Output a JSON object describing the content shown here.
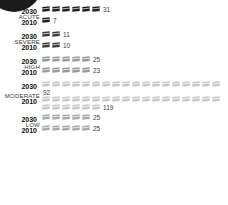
{
  "logo": {
    "name": "dark-rounded-mark"
  },
  "chart_data": {
    "type": "bar",
    "subtype": "pictogram-isotype",
    "title": "",
    "subtitle": "",
    "xlabel": "",
    "ylabel": "",
    "icon_unit": 5,
    "icon_glyph": "flag-icon",
    "categories": [
      "ACUTE",
      "SEVERE",
      "HIGH",
      "MODERATE",
      "LOW"
    ],
    "series": [
      {
        "name": "2030",
        "values": [
          31,
          11,
          25,
          92,
          25
        ]
      },
      {
        "name": "2010",
        "values": [
          7,
          10,
          23,
          119,
          25
        ]
      }
    ],
    "groups": [
      {
        "label": "ACUTE",
        "color": "#1d1d1d",
        "rows": [
          {
            "year": "2030",
            "value": "31",
            "icons": 6
          },
          {
            "year": "2010",
            "value": "7",
            "icons": 1
          }
        ]
      },
      {
        "label": "SEVERE",
        "color": "#3c3c3c",
        "rows": [
          {
            "year": "2030",
            "value": "11",
            "icons": 2
          },
          {
            "year": "2010",
            "value": "10",
            "icons": 2
          }
        ]
      },
      {
        "label": "HIGH",
        "color": "#9a9a9a",
        "rows": [
          {
            "year": "2030",
            "value": "25",
            "icons": 5
          },
          {
            "year": "2010",
            "value": "23",
            "icons": 5
          }
        ]
      },
      {
        "label": "MODERATE",
        "color": "#c9c9c9",
        "rows": [
          {
            "year": "2030",
            "value": "92",
            "icons": 18
          },
          {
            "year": "2010",
            "value": "119",
            "icons": 24
          }
        ]
      },
      {
        "label": "LOW",
        "color": "#a8a8a8",
        "rows": [
          {
            "year": "2030",
            "value": "25",
            "icons": 5
          },
          {
            "year": "2010",
            "value": "25",
            "icons": 5
          }
        ]
      }
    ]
  }
}
